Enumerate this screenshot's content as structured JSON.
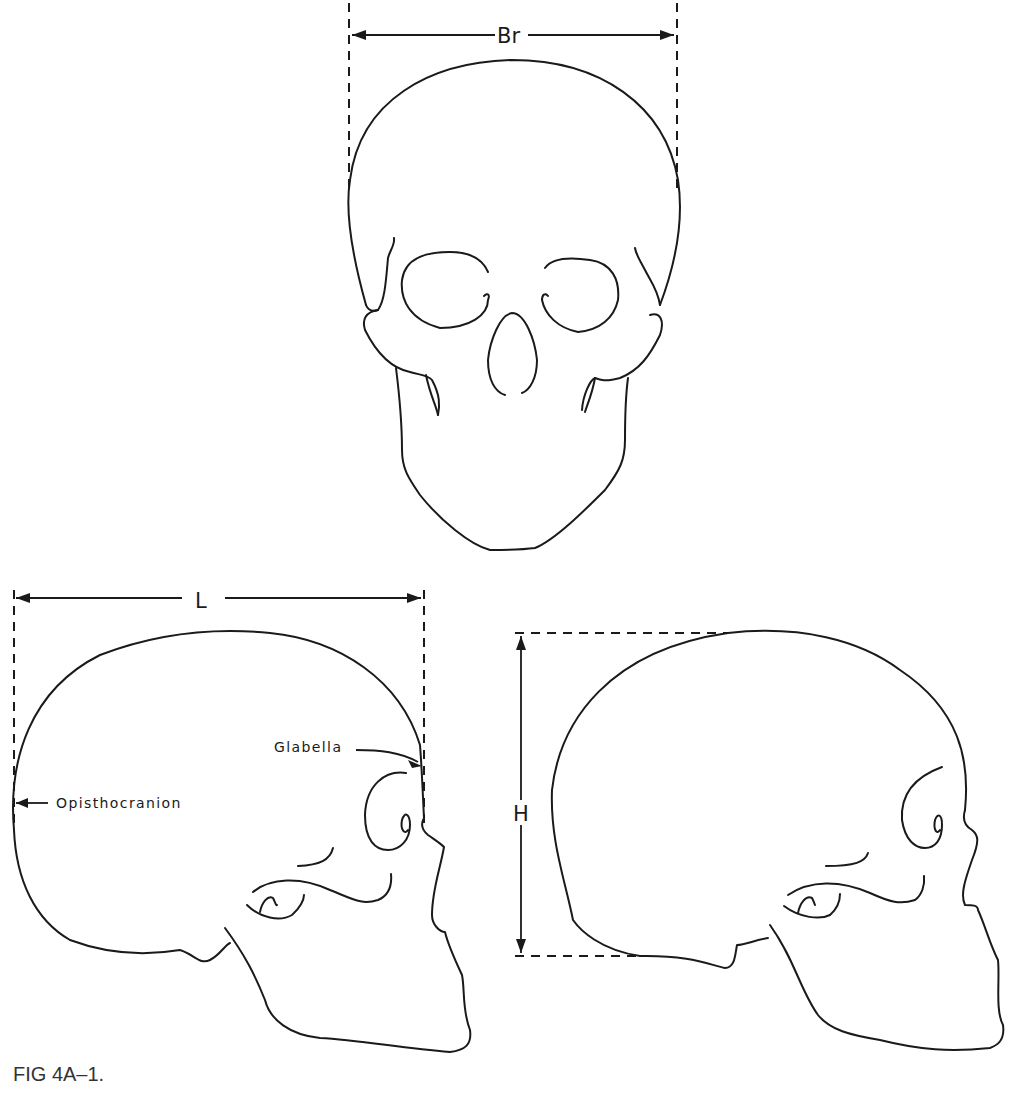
{
  "figure": {
    "caption": "FIG 4A–1.",
    "views": [
      {
        "id": "frontal",
        "name": "Frontal view of skull",
        "measurement": {
          "label": "Br",
          "meaning": "Breadth"
        }
      },
      {
        "id": "lateral-length",
        "name": "Lateral view of skull",
        "measurement": {
          "label": "L",
          "meaning": "Length"
        },
        "landmarks": [
          {
            "label": "Glabella"
          },
          {
            "label": "Opisthocranion"
          }
        ]
      },
      {
        "id": "lateral-height",
        "name": "Lateral view of skull",
        "measurement": {
          "label": "H",
          "meaning": "Height"
        }
      }
    ]
  },
  "labels": {
    "breadth": "Br",
    "length": "L",
    "height": "H",
    "glabella": "Glabella",
    "opisthocranion": "Opisthocranion"
  },
  "colors": {
    "line": "#1a1a1a",
    "background": "#ffffff",
    "caption": "#333333"
  }
}
